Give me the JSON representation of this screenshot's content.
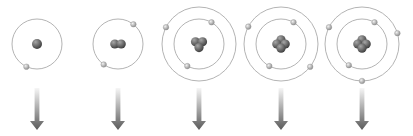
{
  "diagram": {
    "colors": {
      "background": "#ffffff",
      "orbit": "#b4b4b4",
      "electron_light": "#e2e2e2",
      "electron_dark": "#8a8a8a",
      "nucleus_light": "#9a9a9a",
      "nucleus_dark": "#3e3e3e",
      "arrow_top": "#f4f4f4",
      "arrow_bottom": "#5a5a5a"
    },
    "atoms": [
      {
        "name": "atom-1",
        "cx": 37,
        "cy": 44,
        "nucleons": 1,
        "orbits": [
          {
            "r": 25,
            "electrons_deg": [
              115
            ]
          }
        ]
      },
      {
        "name": "atom-2",
        "cx": 118,
        "cy": 44,
        "nucleons": 2,
        "orbits": [
          {
            "r": 25,
            "electrons_deg": [
              -52,
              125
            ]
          }
        ]
      },
      {
        "name": "atom-3",
        "cx": 199,
        "cy": 44,
        "nucleons": 3,
        "orbits": [
          {
            "r": 25,
            "electrons_deg": [
              -60,
              118
            ]
          },
          {
            "r": 37,
            "electrons_deg": [
              -153
            ]
          }
        ]
      },
      {
        "name": "atom-4",
        "cx": 281,
        "cy": 44,
        "nucleons": 4,
        "orbits": [
          {
            "r": 25,
            "electrons_deg": [
              -60,
              118
            ]
          },
          {
            "r": 37,
            "electrons_deg": [
              -152,
              38
            ]
          }
        ]
      },
      {
        "name": "atom-5",
        "cx": 362,
        "cy": 44,
        "nucleons": 4,
        "orbits": [
          {
            "r": 25,
            "electrons_deg": [
              -60,
              122
            ]
          },
          {
            "r": 37,
            "electrons_deg": [
              -153,
              -17,
              90
            ]
          }
        ]
      }
    ],
    "arrows": [
      {
        "x": 37,
        "y1": 88,
        "y2": 130
      },
      {
        "x": 118,
        "y1": 88,
        "y2": 130
      },
      {
        "x": 199,
        "y1": 88,
        "y2": 130
      },
      {
        "x": 281,
        "y1": 88,
        "y2": 130
      },
      {
        "x": 362,
        "y1": 88,
        "y2": 130
      }
    ]
  }
}
